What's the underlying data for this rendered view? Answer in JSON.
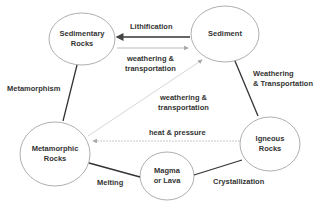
{
  "diagram": {
    "nodes": [
      {
        "id": "sedimentary",
        "line1": "Sedimentary",
        "line2": "Rocks"
      },
      {
        "id": "sediment",
        "line1": "Sediment",
        "line2": ""
      },
      {
        "id": "metamorphic",
        "line1": "Metamorphic",
        "line2": "Rocks"
      },
      {
        "id": "igneous",
        "line1": "Igneous",
        "line2": "Rocks"
      },
      {
        "id": "magma",
        "line1": "Magma",
        "line2": "or Lava"
      }
    ],
    "edges": [
      {
        "from": "sediment",
        "to": "sedimentary",
        "line1": "Lithification",
        "line2": ""
      },
      {
        "from": "sedimentary",
        "to": "sediment",
        "line1": "weathering &",
        "line2": "transportation"
      },
      {
        "from": "sedimentary",
        "to": "metamorphic",
        "line1": "Metamorphism",
        "line2": ""
      },
      {
        "from": "sediment",
        "to": "igneous",
        "line1": "Weathering",
        "line2": "& Transportation"
      },
      {
        "from": "metamorphic",
        "to": "sediment",
        "line1": "weathering &",
        "line2": "transportation"
      },
      {
        "from": "igneous",
        "to": "metamorphic",
        "line1": "heat & pressure",
        "line2": ""
      },
      {
        "from": "metamorphic",
        "to": "magma",
        "line1": "Melting",
        "line2": ""
      },
      {
        "from": "magma",
        "to": "igneous",
        "line1": "Crystallization",
        "line2": ""
      }
    ]
  }
}
